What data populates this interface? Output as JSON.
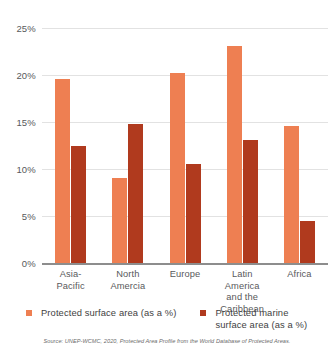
{
  "chart_data": {
    "type": "bar",
    "title": "",
    "subtitle": "",
    "xlabel": "",
    "ylabel": "",
    "ylim": [
      0,
      25
    ],
    "ytick_values": [
      0,
      5,
      10,
      15,
      20,
      25
    ],
    "ytick_labels": [
      "0%",
      "5%",
      "10%",
      "15%",
      "20%",
      "25%"
    ],
    "grid": true,
    "legend_position": "bottom",
    "categories": [
      "Asia-\nPacific",
      "North\nAmercia",
      "Europe",
      "Latin\nAmerica\nand the Caribbean",
      "Africa"
    ],
    "series": [
      {
        "name": "Protected surface area (as a %)",
        "color": "#ee7f52",
        "values": [
          19.6,
          9.0,
          20.2,
          23.1,
          14.6
        ]
      },
      {
        "name": "Protected marine\nsurface area (as a %)",
        "color": "#b03a1e",
        "values": [
          12.5,
          14.8,
          10.5,
          13.1,
          4.5
        ]
      }
    ],
    "source": "Source: UNEP-WCMC, 2020, Protected Area Profile from the World Database of Protected Areas."
  },
  "legend": {
    "items": [
      {
        "label": "Protected surface area (as a %)",
        "color": "#ee7f52"
      },
      {
        "label": "Protected marine\nsurface area (as a %)",
        "color": "#b03a1e"
      }
    ]
  },
  "axis": {
    "y_ticks": [
      "25%",
      "20%",
      "15%",
      "10%",
      "5%",
      "0%"
    ]
  },
  "footer": {
    "source": "Source: UNEP-WCMC, 2020, Protected Area Profile from the World Database of Protected Areas."
  },
  "colors": {
    "series_protected_surface": "#ee7f52",
    "series_protected_marine": "#b03a1e",
    "gridline": "#e2e2e2",
    "axis": "#8d8d8d",
    "text": "#58595b",
    "background": "#ffffff"
  }
}
